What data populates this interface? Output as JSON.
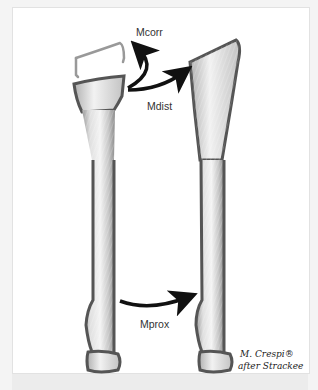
{
  "figure": {
    "labels": {
      "mcorr": "Mcorr",
      "mdist": "Mdist",
      "mprox": "Mprox"
    },
    "credit": {
      "line1": "M. Crespi®",
      "line2": "after Strackee"
    },
    "colors": {
      "outline": "#555555",
      "outline_light": "#999999",
      "bone_fill": "#e8e8e8",
      "shadow": "#8a8a8a",
      "arrow": "#111111",
      "background": "#ffffff",
      "frame_border": "#e2e2e2",
      "bottom_strip": "#ececec"
    }
  }
}
